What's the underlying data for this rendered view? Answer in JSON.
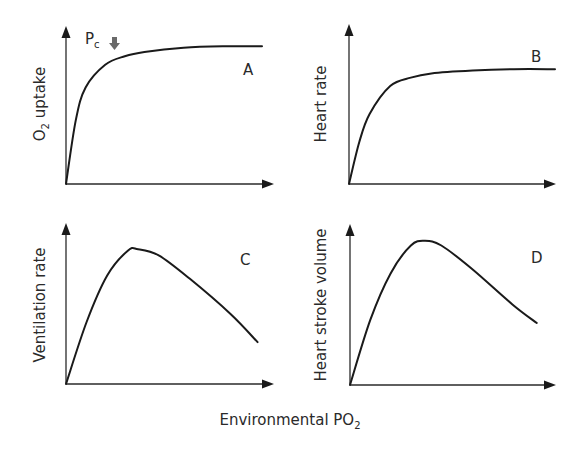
{
  "figure": {
    "xlabel_main": "Environmental PO",
    "xlabel_sub": "2",
    "annotation": {
      "text_main": "P",
      "text_sub": "c",
      "arrow_icon": "down-arrow-icon"
    }
  },
  "chart_data": [
    {
      "type": "line",
      "panel": "A",
      "ylabel_main": "O",
      "ylabel_sub": "2",
      "ylabel_rest": " uptake",
      "xlabel": "Environmental PO2",
      "shape": "saturating",
      "x": [
        0,
        0.05,
        0.1,
        0.2,
        0.3,
        0.4,
        0.6,
        0.8,
        1.0
      ],
      "y": [
        0,
        0.45,
        0.68,
        0.84,
        0.9,
        0.93,
        0.96,
        0.97,
        0.97
      ],
      "annotations": [
        {
          "label": "Pc",
          "x": 0.38
        }
      ]
    },
    {
      "type": "line",
      "panel": "B",
      "ylabel": "Heart rate",
      "xlabel": "Environmental PO2",
      "shape": "saturating",
      "x": [
        0,
        0.05,
        0.1,
        0.2,
        0.3,
        0.4,
        0.6,
        0.8,
        1.0
      ],
      "y": [
        0,
        0.3,
        0.5,
        0.7,
        0.76,
        0.79,
        0.81,
        0.82,
        0.82
      ]
    },
    {
      "type": "line",
      "panel": "C",
      "ylabel": "Ventilation rate",
      "xlabel": "Environmental PO2",
      "shape": "rise-then-decline",
      "x": [
        0,
        0.1,
        0.2,
        0.3,
        0.35,
        0.45,
        0.6,
        0.8,
        0.93
      ],
      "y": [
        0,
        0.4,
        0.7,
        0.86,
        0.87,
        0.83,
        0.68,
        0.45,
        0.27
      ]
    },
    {
      "type": "line",
      "panel": "D",
      "ylabel": "Heart stroke volume",
      "xlabel": "Environmental PO2",
      "shape": "rise-then-decline",
      "x": [
        0,
        0.1,
        0.2,
        0.3,
        0.37,
        0.45,
        0.6,
        0.8,
        0.92
      ],
      "y": [
        0,
        0.42,
        0.72,
        0.9,
        0.93,
        0.9,
        0.75,
        0.52,
        0.4
      ]
    }
  ]
}
